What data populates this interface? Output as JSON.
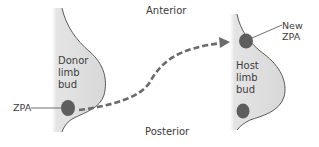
{
  "labels": {
    "anterior": "Anterior",
    "posterior": "Posterior",
    "donor_bud": "Donor\nlimb\nbud",
    "host_bud": "Host\nlimb\nbud",
    "donor_zpa": "ZPA",
    "new_zpa": "New\nZPA"
  },
  "colors": {
    "bud_fill": "#dcdcdc",
    "bud_outline": "#4a4a4a",
    "zpa_spot": "#5e5e5e",
    "arrow": "#6a6a6a",
    "text": "#3a3a3a"
  }
}
